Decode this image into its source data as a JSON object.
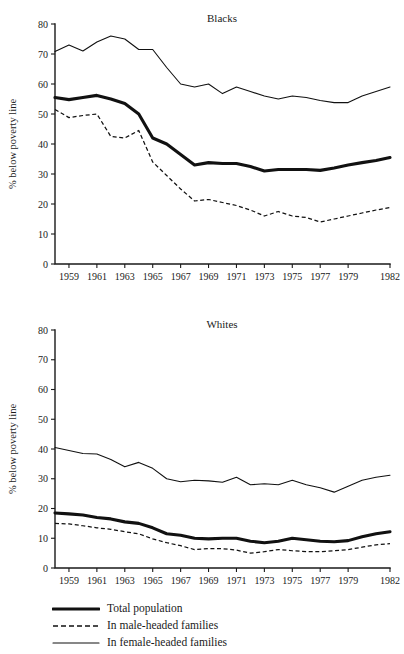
{
  "figure": {
    "ylabel": "% below poverty line",
    "legend": [
      {
        "label": "Total population",
        "style": "thick-solid",
        "key": "total_population"
      },
      {
        "label": "In male-headed families",
        "style": "dashed",
        "key": "male_headed"
      },
      {
        "label": "In female-headed families",
        "style": "thin-solid",
        "key": "female_headed"
      }
    ]
  },
  "chart_data": [
    {
      "type": "line",
      "title": "Blacks",
      "xlabel": "",
      "ylabel": "% below poverty line",
      "xlim": [
        1958,
        1982
      ],
      "ylim": [
        0,
        80
      ],
      "yticks": [
        0,
        10,
        20,
        30,
        40,
        50,
        60,
        70,
        80
      ],
      "xticks": [
        1959,
        1961,
        1963,
        1965,
        1967,
        1969,
        1971,
        1973,
        1975,
        1977,
        1979,
        1982
      ],
      "xticklabels": [
        "1959",
        "1961",
        "1963",
        "1965",
        "1967",
        "1969",
        "1971",
        "1973",
        "1975",
        "1977",
        "1979",
        "1982"
      ],
      "grid": false,
      "legend_position": "below-figure",
      "x": [
        1958,
        1959,
        1960,
        1961,
        1962,
        1963,
        1964,
        1965,
        1966,
        1967,
        1968,
        1969,
        1970,
        1971,
        1972,
        1973,
        1974,
        1975,
        1976,
        1977,
        1978,
        1979,
        1980,
        1981,
        1982
      ],
      "series": [
        {
          "name": "Total population",
          "style": "thick-solid",
          "values": [
            55.5,
            54.8,
            55.5,
            56.2,
            55.0,
            53.5,
            50.0,
            42.0,
            40.0,
            36.5,
            33.0,
            33.8,
            33.5,
            33.5,
            32.5,
            31.0,
            31.5,
            31.5,
            31.5,
            31.2,
            32.0,
            33.0,
            33.8,
            34.5,
            35.5
          ]
        },
        {
          "name": "In male-headed families",
          "style": "dashed",
          "values": [
            51.5,
            48.8,
            49.5,
            50.0,
            42.5,
            42.0,
            44.5,
            34.0,
            29.5,
            25.0,
            21.0,
            21.5,
            20.5,
            19.5,
            18.0,
            16.0,
            17.5,
            16.0,
            15.5,
            14.0,
            15.0,
            16.0,
            17.0,
            18.0,
            18.8
          ]
        },
        {
          "name": "In female-headed families",
          "style": "thin-solid",
          "values": [
            70.8,
            73.0,
            71.0,
            74.0,
            76.0,
            75.0,
            71.5,
            71.5,
            65.5,
            60.0,
            59.0,
            60.0,
            56.8,
            59.0,
            57.5,
            56.0,
            55.0,
            56.0,
            55.5,
            54.5,
            53.8,
            53.8,
            56.0,
            57.5,
            59.0
          ]
        }
      ]
    },
    {
      "type": "line",
      "title": "Whites",
      "xlabel": "",
      "ylabel": "% below poverty line",
      "xlim": [
        1958,
        1982
      ],
      "ylim": [
        0,
        80
      ],
      "yticks": [
        0,
        10,
        20,
        30,
        40,
        50,
        60,
        70,
        80
      ],
      "xticks": [
        1959,
        1961,
        1963,
        1965,
        1967,
        1969,
        1971,
        1973,
        1975,
        1977,
        1979,
        1982
      ],
      "xticklabels": [
        "1959",
        "1961",
        "1963",
        "1965",
        "1967",
        "1969",
        "1971",
        "1973",
        "1975",
        "1977",
        "1979",
        "1982"
      ],
      "grid": false,
      "legend_position": "below-figure",
      "x": [
        1958,
        1959,
        1960,
        1961,
        1962,
        1963,
        1964,
        1965,
        1966,
        1967,
        1968,
        1969,
        1970,
        1971,
        1972,
        1973,
        1974,
        1975,
        1976,
        1977,
        1978,
        1979,
        1980,
        1981,
        1982
      ],
      "series": [
        {
          "name": "Total population",
          "style": "thick-solid",
          "values": [
            18.5,
            18.2,
            17.8,
            17.0,
            16.5,
            15.5,
            15.0,
            13.5,
            11.5,
            11.0,
            10.0,
            9.8,
            10.0,
            10.0,
            9.0,
            8.5,
            9.0,
            10.0,
            9.5,
            9.0,
            8.8,
            9.2,
            10.5,
            11.5,
            12.2
          ]
        },
        {
          "name": "In male-headed families",
          "style": "dashed",
          "values": [
            15.0,
            14.8,
            14.2,
            13.5,
            13.0,
            12.2,
            11.5,
            9.8,
            8.5,
            7.5,
            6.2,
            6.5,
            6.5,
            6.0,
            5.0,
            5.5,
            6.2,
            5.8,
            5.5,
            5.5,
            5.8,
            6.2,
            7.0,
            7.8,
            8.2
          ]
        },
        {
          "name": "In female-headed families",
          "style": "thin-solid",
          "values": [
            40.5,
            39.5,
            38.5,
            38.3,
            36.5,
            34.0,
            35.5,
            33.5,
            30.0,
            29.0,
            29.5,
            29.3,
            28.8,
            30.5,
            28.0,
            28.3,
            28.0,
            29.5,
            28.0,
            27.0,
            25.5,
            27.5,
            29.5,
            30.5,
            31.2
          ]
        }
      ]
    }
  ]
}
